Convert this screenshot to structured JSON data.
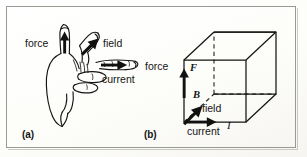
{
  "figure": {
    "border_color": "#9a9a95",
    "ink_color": "#141414",
    "background_color": "#fdfdfb",
    "width": 307,
    "height": 157
  },
  "panels": [
    {
      "id": "a",
      "label": "(a)",
      "caption": "left hand showing mutually perpendicular directions",
      "labels": {
        "force": "force",
        "field": "field",
        "current": "current"
      }
    },
    {
      "id": "b",
      "label": "(b)",
      "caption": "cube showing the same three directions as vectors",
      "labels": {
        "force": "force",
        "field": "field",
        "current": "current"
      },
      "symbols": {
        "force": "F",
        "field": "B",
        "current": "I"
      }
    }
  ],
  "annotations": {
    "panel_a_force": "force",
    "panel_a_field": "field",
    "panel_a_current": "current",
    "panel_a_tag": "(a)",
    "panel_b_force": "force",
    "panel_b_field": "field",
    "panel_b_current": "current",
    "panel_b_tag": "(b)",
    "symbol_force": "F",
    "symbol_field": "B",
    "symbol_current": "I"
  }
}
